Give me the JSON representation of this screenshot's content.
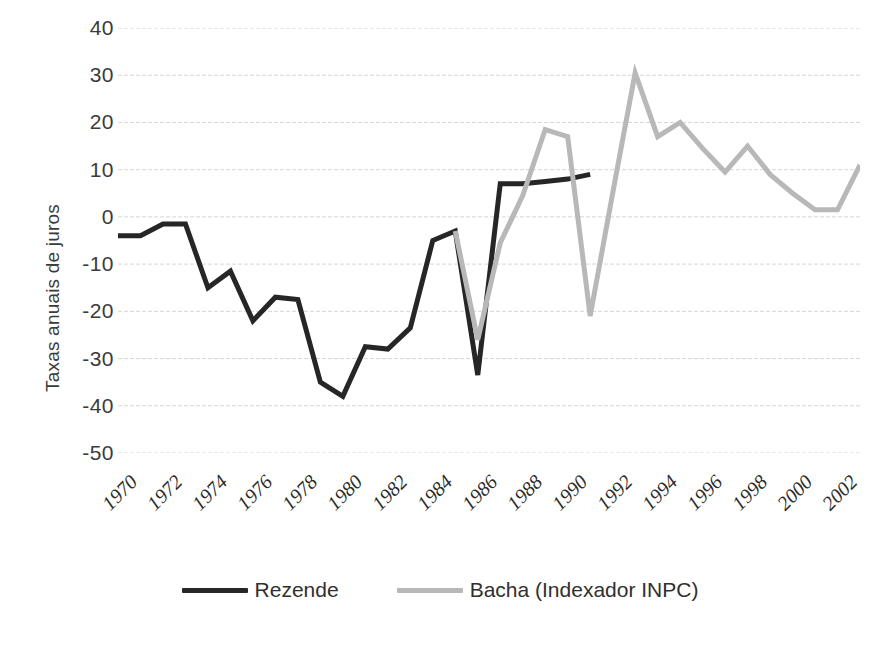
{
  "chart_data": {
    "type": "line",
    "title": "",
    "xlabel": "",
    "ylabel": "Taxas anuais de juros",
    "ylim": [
      -50,
      40
    ],
    "ytick_step": 10,
    "yticks": [
      "40",
      "30",
      "20",
      "10",
      "0",
      "-10",
      "-20",
      "-30",
      "-40",
      "-50"
    ],
    "ytick_values": [
      40,
      30,
      20,
      10,
      0,
      -10,
      -20,
      -30,
      -40,
      -50
    ],
    "xlim": [
      1970,
      2003
    ],
    "xticks": [
      "1970",
      "1972",
      "1974",
      "1976",
      "1978",
      "1980",
      "1982",
      "1984",
      "1986",
      "1988",
      "1990",
      "1992",
      "1994",
      "1996",
      "1998",
      "2000",
      "2002"
    ],
    "xtick_values": [
      1970,
      1972,
      1974,
      1976,
      1978,
      1980,
      1982,
      1984,
      1986,
      1988,
      1990,
      1992,
      1994,
      1996,
      1998,
      2000,
      2002
    ],
    "grid": "horizontal-dashed",
    "legend_position": "bottom-center",
    "series": [
      {
        "name": "Rezende",
        "color": "#262626",
        "width": 5,
        "x": [
          1970,
          1971,
          1972,
          1973,
          1974,
          1975,
          1976,
          1977,
          1978,
          1979,
          1980,
          1981,
          1982,
          1983,
          1984,
          1985,
          1986,
          1987,
          1988,
          1989,
          1990,
          1991
        ],
        "values": [
          -4.0,
          -4.0,
          -1.5,
          -1.5,
          -15.0,
          -11.5,
          -22.0,
          -17.0,
          -17.5,
          -35.0,
          -38.0,
          -27.5,
          -28.0,
          -23.5,
          -5.0,
          -3.0,
          -33.5,
          7.0,
          7.0,
          7.5,
          8.0,
          9.0
        ]
      },
      {
        "name": "Bacha (Indexador INPC)",
        "color": "#b8b8b8",
        "width": 5,
        "x": [
          1985,
          1986,
          1987,
          1988,
          1989,
          1990,
          1991,
          1992,
          1993,
          1994,
          1995,
          1996,
          1997,
          1998,
          1999,
          2000,
          2001,
          2002,
          2003
        ],
        "values": [
          -3.0,
          -26.0,
          -5.5,
          4.5,
          18.5,
          17.0,
          -21.0,
          5.0,
          30.5,
          17.0,
          20.0,
          14.5,
          9.5,
          15.0,
          9.0,
          5.0,
          1.5,
          1.5,
          11.0
        ]
      }
    ]
  },
  "legend": {
    "items": [
      {
        "label": "Rezende",
        "color": "#262626"
      },
      {
        "label": "Bacha (Indexador INPC)",
        "color": "#b8b8b8"
      }
    ]
  }
}
